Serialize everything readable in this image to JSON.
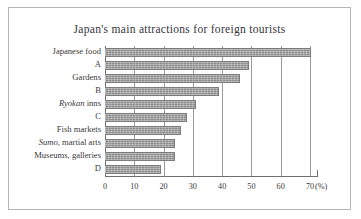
{
  "figure": {
    "title": "Japan's main attractions for foreign tourists",
    "unit_label": "(%)",
    "bar_color": "#8d8d8d",
    "grid_color": "#9b9b9b",
    "axis_color": "#6f6f6f",
    "frame_color": "#b5b5b5",
    "background": "#ffffff"
  },
  "chart_data": {
    "type": "bar",
    "orientation": "horizontal",
    "title": "Japan's main attractions for foreign tourists",
    "xlabel": "(%)",
    "ylabel": "",
    "xlim": [
      0,
      70
    ],
    "xticks": [
      0,
      10,
      20,
      30,
      40,
      50,
      60,
      70
    ],
    "xtick_labels": [
      "0",
      "10",
      "20",
      "30",
      "40",
      "50",
      "60",
      "70"
    ],
    "grid": true,
    "legend": "none",
    "categories": [
      "Japanese food",
      "A",
      "Gardens",
      "B",
      "Ryokan inns",
      "C",
      "Fish markets",
      "Sumo, martial arts",
      "Museums, galleries",
      "D"
    ],
    "values": [
      70.5,
      49,
      46,
      39,
      31,
      28,
      26,
      24,
      24,
      19
    ]
  },
  "categories": [
    {
      "pre": "",
      "italic": "",
      "post": "Japanese food",
      "value": 70.5
    },
    {
      "pre": "",
      "italic": "",
      "post": "A",
      "value": 49
    },
    {
      "pre": "",
      "italic": "",
      "post": "Gardens",
      "value": 46
    },
    {
      "pre": "",
      "italic": "",
      "post": "B",
      "value": 39
    },
    {
      "pre": "",
      "italic": "Ryokan",
      "post": " inns",
      "value": 31
    },
    {
      "pre": "",
      "italic": "",
      "post": "C",
      "value": 28
    },
    {
      "pre": "",
      "italic": "",
      "post": "Fish markets",
      "value": 26
    },
    {
      "pre": "",
      "italic": "Sumo",
      "post": ", martial arts",
      "value": 24
    },
    {
      "pre": "",
      "italic": "",
      "post": "Museums, galleries",
      "value": 24
    },
    {
      "pre": "",
      "italic": "",
      "post": "D",
      "value": 19
    }
  ]
}
